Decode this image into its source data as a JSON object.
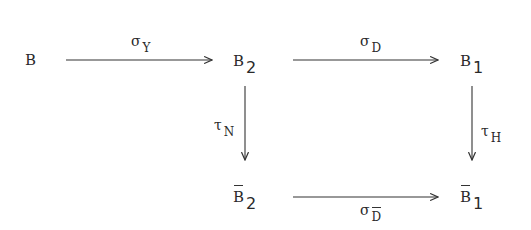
{
  "diagram": {
    "type": "commutative-diagram",
    "nodes": [
      {
        "id": "B",
        "base": "B",
        "subscript": "",
        "overline": false
      },
      {
        "id": "B2",
        "base": "B",
        "subscript": "2",
        "overline": false
      },
      {
        "id": "B1",
        "base": "B",
        "subscript": "1",
        "overline": false
      },
      {
        "id": "B2bar",
        "base": "B",
        "subscript": "2",
        "overline": true
      },
      {
        "id": "B1bar",
        "base": "B",
        "subscript": "1",
        "overline": true
      }
    ],
    "edges": [
      {
        "from": "B",
        "to": "B2",
        "symbol": "σ",
        "subscript": "Y",
        "subscript_overline": false,
        "label_position": "above"
      },
      {
        "from": "B2",
        "to": "B1",
        "symbol": "σ",
        "subscript": "D",
        "subscript_overline": false,
        "label_position": "above"
      },
      {
        "from": "B2",
        "to": "B2bar",
        "symbol": "τ",
        "subscript": "N",
        "subscript_overline": false,
        "label_position": "left"
      },
      {
        "from": "B1",
        "to": "B1bar",
        "symbol": "τ",
        "subscript": "H",
        "subscript_overline": false,
        "label_position": "right"
      },
      {
        "from": "B2bar",
        "to": "B1bar",
        "symbol": "σ",
        "subscript": "D",
        "subscript_overline": true,
        "label_position": "below"
      }
    ]
  }
}
